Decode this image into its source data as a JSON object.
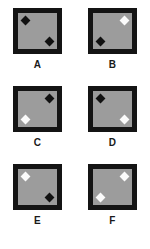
{
  "figure": {
    "name": "diamond-corner-panel-grid",
    "columns": 2,
    "rows": 3,
    "colors": {
      "border": "#141414",
      "interior": "#9c9c9c",
      "diamond_black": "#111111",
      "diamond_white": "#fbfbfb",
      "background": "#ffffff",
      "label": "#1a1a1a"
    },
    "panels": [
      {
        "label": "A",
        "markers": [
          {
            "shape": "diamond",
            "fill": "black",
            "corner": "top-left"
          },
          {
            "shape": "diamond",
            "fill": "black",
            "corner": "bottom-right"
          }
        ]
      },
      {
        "label": "B",
        "markers": [
          {
            "shape": "diamond",
            "fill": "white",
            "corner": "top-right"
          },
          {
            "shape": "diamond",
            "fill": "black",
            "corner": "bottom-left"
          }
        ]
      },
      {
        "label": "C",
        "markers": [
          {
            "shape": "diamond",
            "fill": "black",
            "corner": "top-right"
          },
          {
            "shape": "diamond",
            "fill": "white",
            "corner": "bottom-left"
          }
        ]
      },
      {
        "label": "D",
        "markers": [
          {
            "shape": "diamond",
            "fill": "black",
            "corner": "top-left"
          },
          {
            "shape": "diamond",
            "fill": "white",
            "corner": "bottom-right"
          }
        ]
      },
      {
        "label": "E",
        "markers": [
          {
            "shape": "diamond",
            "fill": "white",
            "corner": "top-left"
          },
          {
            "shape": "diamond",
            "fill": "black",
            "corner": "bottom-right"
          }
        ]
      },
      {
        "label": "F",
        "markers": [
          {
            "shape": "diamond",
            "fill": "white",
            "corner": "top-right"
          },
          {
            "shape": "diamond",
            "fill": "white",
            "corner": "bottom-left"
          }
        ]
      }
    ]
  }
}
